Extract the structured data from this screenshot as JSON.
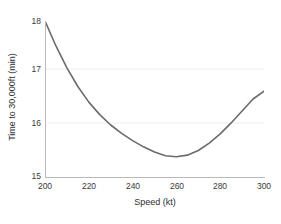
{
  "chart_data": {
    "type": "line",
    "title": "",
    "xlabel": "Speed (kt)",
    "ylabel": "Time to 30,000ft (min)",
    "xlim": [
      200,
      300
    ],
    "ylim": [
      15,
      18
    ],
    "xticks": [
      200,
      220,
      240,
      260,
      280,
      300
    ],
    "yticks": [
      15,
      16,
      17,
      18
    ],
    "xtick_labels": [
      "200",
      "220",
      "240",
      "260",
      "280",
      "300"
    ],
    "ytick_labels": [
      "15",
      "16",
      "17",
      "18"
    ],
    "grid": "horizontal-faint",
    "legend": "none",
    "series": [
      {
        "name": "Time to climb",
        "color": "#6b6b6b",
        "linewidth": 1.5,
        "x": [
          200,
          205,
          210,
          215,
          220,
          225,
          230,
          235,
          240,
          245,
          250,
          255,
          260,
          265,
          270,
          275,
          280,
          285,
          290,
          295,
          300
        ],
        "y": [
          18.0,
          17.52,
          17.1,
          16.74,
          16.44,
          16.2,
          16.0,
          15.84,
          15.7,
          15.58,
          15.48,
          15.41,
          15.39,
          15.42,
          15.51,
          15.65,
          15.83,
          16.04,
          16.27,
          16.5,
          16.65
        ]
      }
    ],
    "annotations": []
  },
  "figure": {
    "background": "#ffffff",
    "axis_color": "#b9b9b9",
    "gridline_color": "#ededed",
    "text_color": "#2e2e2e"
  }
}
